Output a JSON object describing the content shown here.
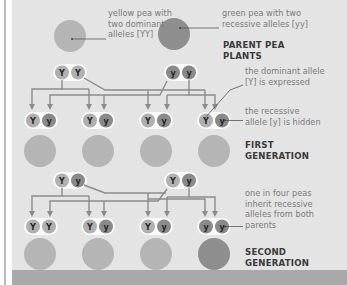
{
  "colors": {
    "panel_bg": "#e4e4e4",
    "yellow_pea": "#b5b5b5",
    "green_pea": "#8e8e8e",
    "dominant_allele": "#b0b0b0",
    "recessive_allele": "#8a8a8a",
    "arrow": "#8c8c8c",
    "footer": "#a9a9a9"
  },
  "parents": {
    "heading": "PARENT PEA\nPLANTS",
    "yellow_pea_label": "yellow pea with\ntwo dominant\nalleles [YY]",
    "green_pea_label": "green pea with two\nrecessive alleles [yy]",
    "yellow_pea_alleles": [
      "Y",
      "Y"
    ],
    "green_pea_alleles": [
      "y",
      "y"
    ]
  },
  "first_generation": {
    "heading": "FIRST\nGENERATION",
    "dominant_note": "the dominant allele\n[Y] is expressed",
    "recessive_note": "the recessive\nallele [y] is hidden",
    "offspring": [
      {
        "alleles": [
          "Y",
          "y"
        ],
        "pea": "yellow"
      },
      {
        "alleles": [
          "Y",
          "y"
        ],
        "pea": "yellow"
      },
      {
        "alleles": [
          "Y",
          "y"
        ],
        "pea": "yellow"
      },
      {
        "alleles": [
          "Y",
          "y"
        ],
        "pea": "yellow"
      }
    ]
  },
  "second_generation": {
    "heading": "SECOND\nGENERATION",
    "note": "one in four peas\ninherit recessive\nalleles from both\nparents",
    "parents": [
      [
        "Y",
        "y"
      ],
      [
        "Y",
        "y"
      ]
    ],
    "offspring": [
      {
        "alleles": [
          "Y",
          "Y"
        ],
        "pea": "yellow"
      },
      {
        "alleles": [
          "Y",
          "y"
        ],
        "pea": "yellow"
      },
      {
        "alleles": [
          "Y",
          "y"
        ],
        "pea": "yellow"
      },
      {
        "alleles": [
          "y",
          "y"
        ],
        "pea": "green"
      }
    ]
  }
}
